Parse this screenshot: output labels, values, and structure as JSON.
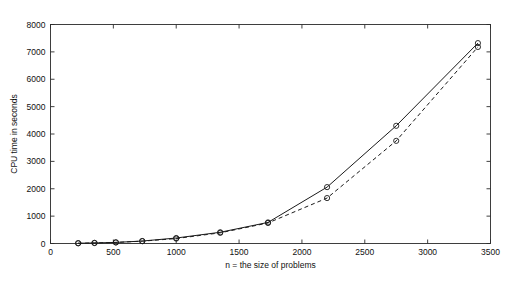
{
  "figure": {
    "background_color": "#ffffff",
    "line_color": "#1a1a1a",
    "width": 521,
    "height": 284
  },
  "axes": {
    "x_title": "n = the size of problems",
    "y_title": "CPU time in seconds",
    "x_ticks": [
      "0",
      "500",
      "1000",
      "1500",
      "2000",
      "2500",
      "3000",
      "3500"
    ],
    "y_ticks": [
      "0",
      "1000",
      "2000",
      "3000",
      "4000",
      "5000",
      "6000",
      "7000",
      "8000"
    ]
  },
  "chart_data": {
    "type": "line",
    "title": "",
    "subtitle": "",
    "xlabel": "n = the size of problems",
    "ylabel": "CPU time in seconds",
    "xlim": [
      0,
      3500
    ],
    "ylim": [
      0,
      8000
    ],
    "xticks": [
      0,
      500,
      1000,
      1500,
      2000,
      2500,
      3000,
      3500
    ],
    "yticks": [
      0,
      1000,
      2000,
      3000,
      4000,
      5000,
      6000,
      7000,
      8000
    ],
    "grid": false,
    "legend": null,
    "legend_position": "none",
    "marker": "circle",
    "x": [
      220,
      350,
      520,
      730,
      1000,
      1350,
      1730,
      2200,
      2750,
      3400
    ],
    "series": [
      {
        "name": "solid",
        "linestyle": "solid",
        "values": [
          10,
          20,
          40,
          90,
          200,
          410,
          770,
          2060,
          4300,
          7320
        ]
      },
      {
        "name": "dashed",
        "linestyle": "dashed",
        "values": [
          10,
          20,
          40,
          85,
          180,
          390,
          750,
          1660,
          3750,
          7180
        ]
      }
    ]
  }
}
